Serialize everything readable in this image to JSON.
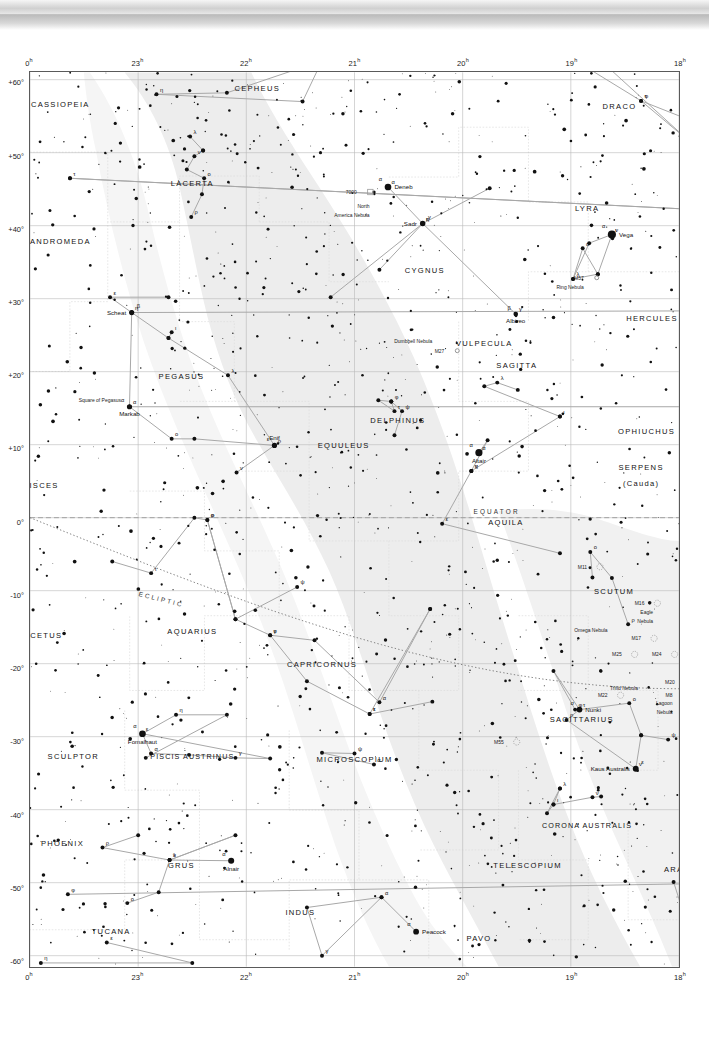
{
  "chart_data": {
    "type": "scatter",
    "xlabel": "Right Ascension",
    "ylabel": "Declination",
    "xlim": [
      24,
      18
    ],
    "ylim": [
      -60,
      60
    ],
    "grid": true,
    "legend": "none",
    "ra_ticks": [
      "0",
      "23",
      "22",
      "21",
      "20",
      "19",
      "18"
    ],
    "ra_unit": "h",
    "dec_ticks": [
      "+60°",
      "+50°",
      "+40°",
      "+30°",
      "+20°",
      "+10°",
      "0°",
      "-10°",
      "-20°",
      "-30°",
      "-40°",
      "-50°",
      "-60°"
    ],
    "reference_lines": [
      {
        "name": "EQUATOR",
        "style": "dashed"
      },
      {
        "name": "ECLIPTIC",
        "style": "dotted"
      }
    ],
    "constellations": [
      {
        "name": "CEPHEUS",
        "ra": 21.9,
        "dec": 58.5
      },
      {
        "name": "CASSIOPEIA",
        "ra": 23.72,
        "dec": 56.2
      },
      {
        "name": "DRACO",
        "ra": 18.55,
        "dec": 56.0
      },
      {
        "name": "LACERTA",
        "ra": 22.5,
        "dec": 45.5
      },
      {
        "name": "ANDROMEDA",
        "ra": 23.72,
        "dec": 37.5
      },
      {
        "name": "LYRA",
        "ra": 18.85,
        "dec": 42.0
      },
      {
        "name": "CYGNUS",
        "ra": 20.35,
        "dec": 33.5
      },
      {
        "name": "HERCULES",
        "ra": 18.25,
        "dec": 27.0
      },
      {
        "name": "VULPECULA",
        "ra": 19.8,
        "dec": 23.5
      },
      {
        "name": "PEGASUS",
        "ra": 22.6,
        "dec": 19.0
      },
      {
        "name": "SAGITTA",
        "ra": 19.5,
        "dec": 20.5
      },
      {
        "name": "DELPHINUS",
        "ra": 20.6,
        "dec": 13.0
      },
      {
        "name": "EQUULEUS",
        "ra": 21.1,
        "dec": 9.5
      },
      {
        "name": "OPHIUCHUS",
        "ra": 18.3,
        "dec": 11.5
      },
      {
        "name": "SERPENS",
        "ra": 18.35,
        "dec": 6.5
      },
      {
        "name": "(Cauda)",
        "ra": 18.35,
        "dec": 4.3
      },
      {
        "name": "PISCES",
        "ra": 23.9,
        "dec": 4.0
      },
      {
        "name": "AQUILA",
        "ra": 19.6,
        "dec": -1.0
      },
      {
        "name": "SCUTUM",
        "ra": 18.6,
        "dec": -10.5
      },
      {
        "name": "CETUS",
        "ra": 23.85,
        "dec": -16.5
      },
      {
        "name": "AQUARIUS",
        "ra": 22.5,
        "dec": -16.0
      },
      {
        "name": "CAPRICORNUS",
        "ra": 21.3,
        "dec": -20.5
      },
      {
        "name": "SAGITTARIUS",
        "ra": 18.9,
        "dec": -28.0
      },
      {
        "name": "PISCIS AUSTRINUS",
        "ra": 22.5,
        "dec": -33.0
      },
      {
        "name": "SCULPTOR",
        "ra": 23.6,
        "dec": -33.0
      },
      {
        "name": "MICROSCOPIUM",
        "ra": 21.0,
        "dec": -33.5
      },
      {
        "name": "CORONA AUSTRALIS",
        "ra": 18.85,
        "dec": -42.5
      },
      {
        "name": "PHOENIX",
        "ra": 23.7,
        "dec": -45.0
      },
      {
        "name": "GRUS",
        "ra": 22.6,
        "dec": -48.0
      },
      {
        "name": "ARA",
        "ra": 18.05,
        "dec": -48.5
      },
      {
        "name": "TELESCOPIUM",
        "ra": 19.4,
        "dec": -48.0
      },
      {
        "name": "INDUS",
        "ra": 21.5,
        "dec": -54.5
      },
      {
        "name": "TUCANA",
        "ra": 23.25,
        "dec": -57.0
      },
      {
        "name": "PAVO",
        "ra": 19.85,
        "dec": -58.0
      }
    ],
    "named_stars": [
      {
        "name": "Caph",
        "bayer": "β",
        "ra": 0.15,
        "dec": 59.0,
        "mag": 2.2,
        "side": "left"
      },
      {
        "name": "Deneb",
        "bayer": "α",
        "ra": 20.69,
        "dec": 45.3,
        "mag": 1.2,
        "side": "right"
      },
      {
        "name": "Sadr",
        "bayer": "γ",
        "ra": 20.37,
        "dec": 40.3,
        "mag": 2.2,
        "side": "left"
      },
      {
        "name": "Vega",
        "bayer": "α",
        "ra": 18.62,
        "dec": 38.8,
        "mag": 0.0,
        "side": "right"
      },
      {
        "name": "Alpheratz",
        "bayer": "α",
        "ra": 0.14,
        "dec": 29.1,
        "mag": 2.0,
        "side": "below"
      },
      {
        "name": "Scheat",
        "bayer": "β",
        "ra": 23.06,
        "dec": 28.1,
        "mag": 2.4,
        "side": "left"
      },
      {
        "name": "Albireo",
        "bayer": "β",
        "ra": 19.51,
        "dec": 27.9,
        "mag": 3.0,
        "side": "below"
      },
      {
        "name": "Algenib",
        "bayer": "γ",
        "ra": 0.22,
        "dec": 15.2,
        "mag": 2.8,
        "side": "left"
      },
      {
        "name": "Markab",
        "bayer": "α",
        "ra": 23.08,
        "dec": 15.2,
        "mag": 2.4,
        "side": "below"
      },
      {
        "name": "Enif",
        "bayer": "ε",
        "ra": 21.74,
        "dec": 9.9,
        "mag": 2.4,
        "side": "above"
      },
      {
        "name": "Altair",
        "bayer": "α",
        "ra": 19.85,
        "dec": 8.9,
        "mag": 0.8,
        "side": "below"
      },
      {
        "name": "Nunki",
        "bayer": "σ",
        "ra": 18.92,
        "dec": -26.3,
        "mag": 2.0,
        "side": "right"
      },
      {
        "name": "Fomalhaut",
        "bayer": "α",
        "ra": 22.96,
        "dec": -29.6,
        "mag": 1.2,
        "side": "below"
      },
      {
        "name": "Kaus Australis",
        "bayer": "ε",
        "ra": 18.4,
        "dec": -34.4,
        "mag": 1.8,
        "side": "left"
      },
      {
        "name": "Ankaa",
        "bayer": "α",
        "ra": 0.44,
        "dec": -42.3,
        "mag": 2.4,
        "side": "right"
      },
      {
        "name": "Alnair",
        "bayer": "α",
        "ra": 22.14,
        "dec": -47.0,
        "mag": 1.7,
        "side": "below"
      },
      {
        "name": "Peacock",
        "bayer": "α",
        "ra": 20.43,
        "dec": -56.7,
        "mag": 1.9,
        "side": "right"
      }
    ],
    "deep_sky_objects": [
      {
        "label": "7000",
        "ra": 20.98,
        "dec": 44.3,
        "type": "nebula"
      },
      {
        "label": "North",
        "ra": 20.86,
        "dec": 42.4,
        "type": "nebula-name"
      },
      {
        "label": "America Nebula",
        "ra": 20.86,
        "dec": 41.2,
        "type": "nebula-name"
      },
      {
        "label": "M57",
        "ra": 18.88,
        "dec": 32.6,
        "type": "planetary"
      },
      {
        "label": "Ring Nebula",
        "ra": 18.88,
        "dec": 31.3,
        "type": "nebula-name"
      },
      {
        "label": "Dumbbell Nebula",
        "ra": 20.28,
        "dec": 23.9,
        "type": "nebula-name"
      },
      {
        "label": "M27",
        "ra": 20.17,
        "dec": 22.6,
        "type": "planetary"
      },
      {
        "label": "M11",
        "ra": 18.85,
        "dec": -7.0,
        "type": "cluster"
      },
      {
        "label": "M16",
        "ra": 18.32,
        "dec": -12.0,
        "type": "cluster"
      },
      {
        "label": "Eagle",
        "ra": 18.24,
        "dec": -13.2,
        "type": "nebula-name"
      },
      {
        "label": "Nebula",
        "ra": 18.24,
        "dec": -14.4,
        "type": "nebula-name"
      },
      {
        "label": "Omega Nebula",
        "ra": 18.66,
        "dec": -15.6,
        "type": "nebula-name"
      },
      {
        "label": "M17",
        "ra": 18.35,
        "dec": -16.8,
        "type": "cluster"
      },
      {
        "label": "M25",
        "ra": 18.53,
        "dec": -19.0,
        "type": "cluster"
      },
      {
        "label": "M24",
        "ra": 18.16,
        "dec": -19.0,
        "type": "cluster"
      },
      {
        "label": "M20",
        "ra": 18.04,
        "dec": -22.8,
        "type": "nebula"
      },
      {
        "label": "Trifid Nebula",
        "ra": 18.38,
        "dec": -23.6,
        "type": "nebula-name"
      },
      {
        "label": "M22",
        "ra": 18.66,
        "dec": -24.6,
        "type": "cluster"
      },
      {
        "label": "M8",
        "ra": 18.06,
        "dec": -24.5,
        "type": "nebula"
      },
      {
        "label": "Lagoon",
        "ra": 18.06,
        "dec": -25.7,
        "type": "nebula-name"
      },
      {
        "label": "Nebula",
        "ra": 18.06,
        "dec": -26.9,
        "type": "nebula-name"
      },
      {
        "label": "M55",
        "ra": 19.62,
        "dec": -31.0,
        "type": "cluster"
      }
    ]
  },
  "axes": {
    "ra_top": [
      "0",
      "23",
      "22",
      "21",
      "20",
      "19",
      "18"
    ],
    "ra_bottom": [
      "0",
      "23",
      "22",
      "21",
      "20",
      "19",
      "18"
    ],
    "dec_left": [
      "+60°",
      "+50°",
      "+40°",
      "+30°",
      "+20°",
      "+10°",
      "0°",
      "-10°",
      "-20°",
      "-30°",
      "-40°",
      "-50°",
      "-60°"
    ],
    "ra_suffix": "h"
  },
  "labels": {
    "equator": "EQUATOR",
    "ecliptic": "ECLIPTIC",
    "square_of_pegasus": "Square of Pegasus"
  },
  "colors": {
    "background": "#ffffff",
    "frame": "#5a5a5a",
    "grid": "#b9b9b9",
    "star": "#111111",
    "milkyway": "#ededed",
    "constellation_line": "#a8a8a8",
    "boundary": "#dcdcdc",
    "ecliptic": "#777777",
    "equator": "#9a9a9a"
  }
}
